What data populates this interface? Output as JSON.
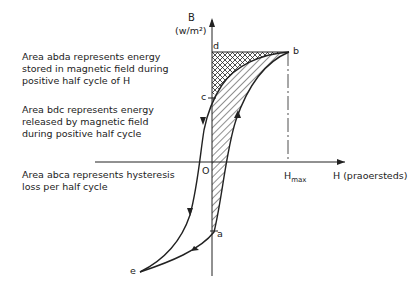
{
  "axes": {
    "y_label": "B",
    "y_unit": "(w/m²)",
    "x_label": "H (praoersteds)",
    "origin": "O",
    "hmax_main": "H",
    "hmax_sub": "max"
  },
  "points": {
    "a": "a",
    "b": "b",
    "c": "c",
    "d": "d",
    "e": "e"
  },
  "notes": [
    {
      "text": "Area abda represents energy\nstored in magnetic field during\npositive half cycle of H"
    },
    {
      "text": "Area bdc represents energy\nreleased by magnetic field\nduring positive half cycle"
    },
    {
      "text": "Area abca represents hysteresis\nloss per half cycle"
    }
  ]
}
